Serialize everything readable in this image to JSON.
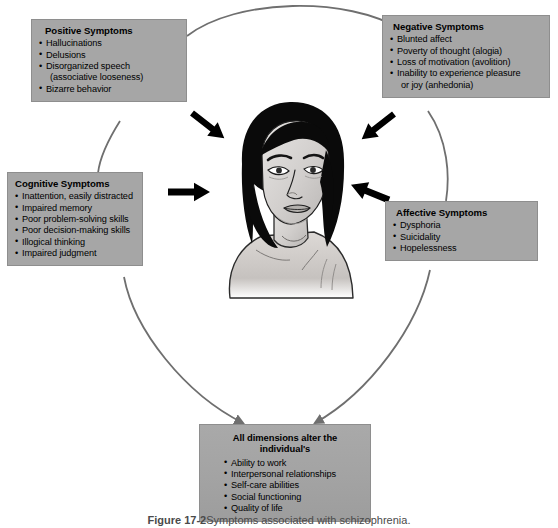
{
  "figure": {
    "caption_label": "Figure 17-2",
    "caption_text": "Symptoms associated with schizophrenia.",
    "illustration_alt": "Illustration of a young woman with dark shoulder-length hair, head tilted, looking distressed"
  },
  "colors": {
    "box_fill": "#a6a6a6",
    "box_border": "#8e8e8e",
    "connector": "#777777",
    "inward_arrow": "#000000",
    "background": "#ffffff"
  },
  "boxes": [
    {
      "id": "positive",
      "title": "Positive Symptoms",
      "items": [
        {
          "text": "Hallucinations",
          "cont": false
        },
        {
          "text": "Delusions",
          "cont": false
        },
        {
          "text": "Disorganized speech",
          "cont": false
        },
        {
          "text": "(associative looseness)",
          "cont": true
        },
        {
          "text": "Bizarre behavior",
          "cont": false
        }
      ]
    },
    {
      "id": "negative",
      "title": "Negative Symptoms",
      "items": [
        {
          "text": "Blunted affect",
          "cont": false
        },
        {
          "text": "Poverty of thought (alogia)",
          "cont": false
        },
        {
          "text": "Loss of motivation (avolition)",
          "cont": false
        },
        {
          "text": "Inability to experience pleasure",
          "cont": false
        },
        {
          "text": "or joy (anhedonia)",
          "cont": true
        }
      ]
    },
    {
      "id": "cognitive",
      "title": "Cognitive Symptoms",
      "items": [
        {
          "text": "Inattention, easily distracted",
          "cont": false
        },
        {
          "text": "Impaired memory",
          "cont": false
        },
        {
          "text": "Poor problem-solving skills",
          "cont": false
        },
        {
          "text": "Poor decision-making skills",
          "cont": false
        },
        {
          "text": "Illogical thinking",
          "cont": false
        },
        {
          "text": "Impaired judgment",
          "cont": false
        }
      ]
    },
    {
      "id": "affective",
      "title": "Affective Symptoms",
      "items": [
        {
          "text": "Dysphoria",
          "cont": false
        },
        {
          "text": "Suicidality",
          "cont": false
        },
        {
          "text": "Hopelessness",
          "cont": false
        }
      ]
    },
    {
      "id": "outcome",
      "title": "All dimensions alter the individual's",
      "items": [
        {
          "text": "Ability to work",
          "cont": false
        },
        {
          "text": "Interpersonal relationships",
          "cont": false
        },
        {
          "text": "Self-care abilities",
          "cont": false
        },
        {
          "text": "Social functioning",
          "cont": false
        },
        {
          "text": "Quality of life",
          "cont": false
        }
      ]
    }
  ],
  "connectors": {
    "arc_top_label": "positive-to-negative-arc",
    "arc_left_label": "positive-to-cognitive-arc",
    "arc_right_label": "negative-to-affective-arc",
    "arrow_left_outcome_label": "cognitive-to-outcome-arrow",
    "arrow_right_outcome_label": "affective-to-outcome-arrow",
    "inward_arrow_count": "4"
  }
}
